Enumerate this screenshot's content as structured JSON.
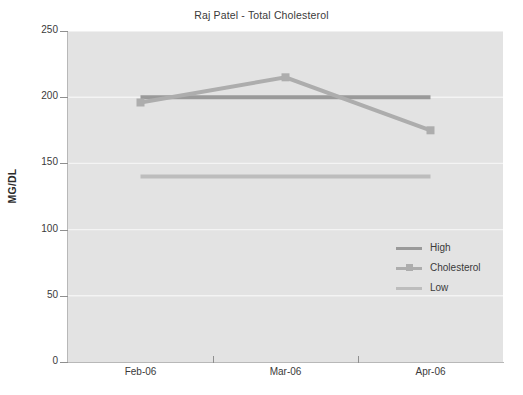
{
  "chart_data": {
    "type": "line",
    "title": "Raj Patel - Total Cholesterol",
    "xlabel": "",
    "ylabel": "MG/DL",
    "categories": [
      "Feb-06",
      "Mar-06",
      "Apr-06"
    ],
    "ylim": [
      0,
      250
    ],
    "ytick_values": [
      250,
      200,
      150,
      100,
      50,
      0
    ],
    "ytick_labels": [
      "250",
      "200",
      "150",
      "100",
      "50",
      "0"
    ],
    "ystep": 50,
    "grid": true,
    "grid_axis": "y",
    "legend_position": "inside-right-middle",
    "series": [
      {
        "name": "High",
        "values": [
          200,
          200,
          200
        ],
        "color": "#9a9a9a",
        "markers": false,
        "width": 4
      },
      {
        "name": "Cholesterol",
        "values": [
          196,
          215,
          175
        ],
        "color": "#adadad",
        "markers": true,
        "width": 4
      },
      {
        "name": "Low",
        "values": [
          140,
          140,
          140
        ],
        "color": "#bdbdbd",
        "markers": false,
        "width": 4
      }
    ],
    "colors": {
      "plot_background": "#e3e3e3",
      "page_background": "#ffffff",
      "gridline": "#f4f4f4",
      "axis": "#b8b8b8",
      "text": "#3a3a3a"
    }
  },
  "legend": {
    "items": [
      {
        "label": "High"
      },
      {
        "label": "Cholesterol"
      },
      {
        "label": "Low"
      }
    ]
  }
}
